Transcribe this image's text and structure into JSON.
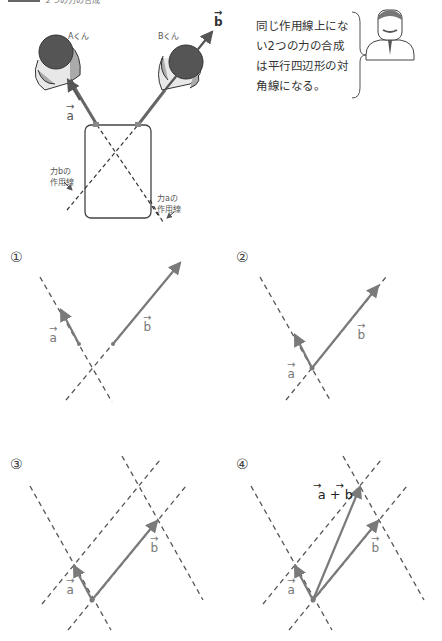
{
  "header": {
    "caption_text": "２つの力の合成"
  },
  "illustration": {
    "person_a_label": "Aくん",
    "person_b_label": "Bくん",
    "vector_a_label": "a",
    "vector_b_label": "b",
    "line_b_caption_line1": "力b",
    "line_b_caption_line2": "の",
    "line_b_caption_line3": "作用線",
    "line_a_caption_line1": "力a",
    "line_a_caption_line2": "の",
    "line_a_caption_line3": "作用線"
  },
  "speech": {
    "lines": [
      "同じ作用線上にな",
      "い2つの力の合成",
      "は平行四辺形の対",
      "角線になる。"
    ]
  },
  "diagrams": [
    {
      "number": "①",
      "a_label": "a",
      "b_label": "b"
    },
    {
      "number": "②",
      "a_label": "a",
      "b_label": "b"
    },
    {
      "number": "③",
      "a_label": "a",
      "b_label": "b"
    },
    {
      "number": "④",
      "a_label": "a",
      "b_label": "b",
      "sum_label": "a + b"
    }
  ],
  "colors": {
    "vector": "#7a7a7a",
    "dashed_line": "#555555",
    "text": "#333333"
  }
}
